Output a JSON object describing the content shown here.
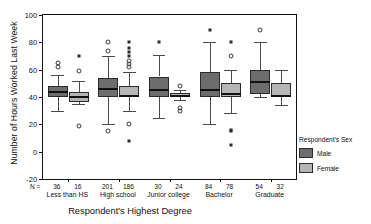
{
  "chart_data": {
    "type": "box",
    "title": "",
    "xlabel": "Respondent's Highest Degree",
    "ylabel": "Number of Hours Worked Last Week",
    "ylim": [
      -20,
      100
    ],
    "yticks": [
      -20,
      0,
      20,
      40,
      60,
      80,
      100
    ],
    "ytick_labels": [
      "-20",
      "0",
      "20",
      "40",
      "60",
      "80",
      "100"
    ],
    "grid": false,
    "n_prefix": "N =",
    "legend": {
      "title": "Respondent's Sex",
      "position": "right",
      "entries": [
        {
          "name": "Male",
          "color": "#6d6d6d"
        },
        {
          "name": "Female",
          "color": "#b6b6b6"
        }
      ]
    },
    "categories": [
      "Less than HS",
      "High school",
      "Junior college",
      "Bachelor",
      "Graduate"
    ],
    "series": [
      {
        "name": "Male",
        "color": "#6d6d6d",
        "boxes": [
          {
            "category": "Less than HS",
            "n": 36,
            "whisker_low": 30.0,
            "q1": 40.0,
            "median": 44.0,
            "q3": 48.0,
            "whisker_high": 56.0,
            "outliers_circle": [
              62.0,
              65.0
            ],
            "outliers_star": []
          },
          {
            "category": "High school",
            "n": 201,
            "whisker_low": 20.0,
            "q1": 40.0,
            "median": 46.0,
            "q3": 54.0,
            "whisker_high": 70.0,
            "outliers_circle": [
              15.0,
              74.0,
              80.0
            ],
            "outliers_star": []
          },
          {
            "category": "Junior college",
            "n": 30,
            "whisker_low": 25.0,
            "q1": 40.0,
            "median": 45.0,
            "q3": 55.0,
            "whisker_high": 71.0,
            "outliers_circle": [],
            "outliers_star": [
              80.0
            ]
          },
          {
            "category": "Bachelor",
            "n": 84,
            "whisker_low": 20.0,
            "q1": 40.0,
            "median": 45.0,
            "q3": 58.0,
            "whisker_high": 80.0,
            "outliers_circle": [],
            "outliers_star": [
              89.0
            ]
          },
          {
            "category": "Graduate",
            "n": 54,
            "whisker_low": 40.0,
            "q1": 42.0,
            "median": 51.0,
            "q3": 60.0,
            "whisker_high": 80.0,
            "outliers_circle": [
              89.0
            ],
            "outliers_star": []
          }
        ]
      },
      {
        "name": "Female",
        "color": "#b6b6b6",
        "boxes": [
          {
            "category": "Less than HS",
            "n": 16,
            "whisker_low": 35.0,
            "q1": 36.0,
            "median": 40.0,
            "q3": 44.0,
            "whisker_high": 52.0,
            "outliers_circle": [
              19.0,
              59.0
            ],
            "outliers_star": [
              70.0
            ]
          },
          {
            "category": "High school",
            "n": 186,
            "whisker_low": 30.0,
            "q1": 40.0,
            "median": 41.0,
            "q3": 48.0,
            "whisker_high": 58.0,
            "outliers_circle": [
              20.0,
              62.0,
              64.0,
              66.0
            ],
            "outliers_star": [
              8.0,
              70.0,
              73.0,
              76.0,
              80.0
            ]
          },
          {
            "category": "Junior college",
            "n": 24,
            "whisker_low": 38.0,
            "q1": 40.0,
            "median": 41.0,
            "q3": 43.0,
            "whisker_high": 45.0,
            "outliers_circle": [
              30.0,
              32.0,
              48.0
            ],
            "outliers_star": []
          },
          {
            "category": "Bachelor",
            "n": 78,
            "whisker_low": 28.0,
            "q1": 40.0,
            "median": 42.0,
            "q3": 50.0,
            "whisker_high": 60.0,
            "outliers_circle": [
              70.0
            ],
            "outliers_star": [
              5.0,
              15.0,
              16.0,
              80.0
            ]
          },
          {
            "category": "Graduate",
            "n": 32,
            "whisker_low": 34.0,
            "q1": 40.0,
            "median": 41.0,
            "q3": 50.0,
            "whisker_high": 60.0,
            "outliers_circle": [],
            "outliers_star": []
          }
        ]
      }
    ]
  }
}
